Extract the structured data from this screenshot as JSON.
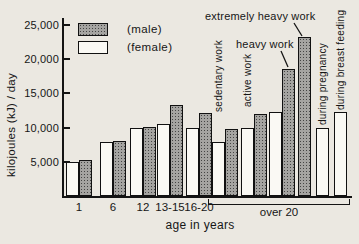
{
  "figure": {
    "background_color": "#ebe8e1",
    "ink_color": "#141414",
    "male_fill_color": "#a5a4a1",
    "female_fill_color": "#faf9f4"
  },
  "legend": {
    "male_label": "(male)",
    "female_label": "(female)"
  },
  "chart_data": {
    "type": "bar",
    "title": "",
    "xlabel": "age in years",
    "ylabel": "kilojoules (kJ) / day",
    "ylim": [
      0,
      25000
    ],
    "yticks": [
      5000,
      10000,
      15000,
      20000,
      25000
    ],
    "ytick_labels": [
      "5,000",
      "10,000",
      "15,000",
      "20,000",
      "25,000"
    ],
    "grid": false,
    "legend_position": "top-left-inside",
    "series_names": [
      "female",
      "male"
    ],
    "groups": [
      {
        "label": "1",
        "bars": [
          {
            "series": "female",
            "value": 4900
          },
          {
            "series": "male",
            "value": 5200
          }
        ]
      },
      {
        "label": "6",
        "bars": [
          {
            "series": "female",
            "value": 7900
          },
          {
            "series": "male",
            "value": 8100
          }
        ]
      },
      {
        "label": "12",
        "bars": [
          {
            "series": "female",
            "value": 9900
          },
          {
            "series": "male",
            "value": 10100
          }
        ]
      },
      {
        "label": "13-15",
        "bars": [
          {
            "series": "female",
            "value": 10500
          },
          {
            "series": "male",
            "value": 13300
          }
        ]
      },
      {
        "label": "16-20",
        "bars": [
          {
            "series": "female",
            "value": 9900
          },
          {
            "series": "male",
            "value": 12200
          }
        ]
      },
      {
        "label": "over 20",
        "bracket": true,
        "subgroups": [
          {
            "label": "sedentary work",
            "label_style": "rotated",
            "bars": [
              {
                "series": "female",
                "value": 7900
              },
              {
                "series": "male",
                "value": 9800
              }
            ]
          },
          {
            "label": "active work",
            "label_style": "rotated",
            "bars": [
              {
                "series": "female",
                "value": 9900
              },
              {
                "series": "male",
                "value": 12000
              }
            ]
          },
          {
            "label": "heavy work",
            "label_style": "callout",
            "bars": [
              {
                "series": "female",
                "value": 12300
              },
              {
                "series": "male",
                "value": 18600
              }
            ]
          },
          {
            "label": "extremely heavy work",
            "label_style": "callout",
            "bars": [
              {
                "series": "male",
                "value": 23200
              }
            ]
          },
          {
            "label": "during pregnancy",
            "label_style": "rotated",
            "bars": [
              {
                "series": "female",
                "value": 9900
              }
            ]
          },
          {
            "label": "during breast feeding",
            "label_style": "rotated",
            "bars": [
              {
                "series": "female",
                "value": 12300
              }
            ]
          }
        ]
      }
    ]
  }
}
